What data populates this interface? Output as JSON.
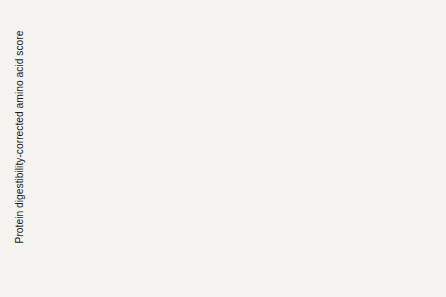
{
  "figure": {
    "background": "#f4f3f0",
    "plot_background": "#fbfaf8"
  },
  "chart_data": {
    "type": "bar",
    "title": "",
    "xlabel": "",
    "ylabel": "Protein digestibility-corrected amino acid score",
    "ylim": [
      0,
      1.2
    ],
    "minor_tick_step": 0.1,
    "grid": false,
    "legend": "none",
    "yticks": [
      0.0,
      0.2,
      0.4,
      0.6,
      0.8,
      1.0,
      1.2
    ],
    "ytick_labels": [
      "0.0",
      "0.2",
      "0.4",
      "0.6",
      "0.8",
      "1.0",
      "1.2"
    ],
    "categories": [
      "Casein",
      "Egg white",
      "Soy protein concentrate",
      "Soy protein isolate",
      "Beef",
      "Pea flour",
      "Kidney beans",
      "Rolled oats",
      "Lentils",
      "Peanut meal",
      "Whole wheat",
      "Wheat gluten"
    ],
    "category_label_lines": [
      [
        "Casein"
      ],
      [
        "Egg",
        "white"
      ],
      [
        "Soy",
        "protein",
        "concentrate"
      ],
      [
        "Soy",
        "protein",
        "isolate"
      ],
      [
        "Beef"
      ],
      [
        "Pea",
        "flour"
      ],
      [
        "Kidney",
        "beans"
      ],
      [
        "Rolled",
        "oats"
      ],
      [
        "Lentils"
      ],
      [
        "Peanut",
        "meal"
      ],
      [
        "Whole",
        "wheat"
      ],
      [
        "Wheat",
        "gluten"
      ]
    ],
    "values": [
      1.0,
      1.0,
      0.99,
      0.92,
      0.92,
      0.69,
      0.68,
      0.57,
      0.52,
      0.52,
      0.42,
      0.25
    ],
    "bar_fills": [
      "solid",
      "solid",
      "open",
      "open",
      "solid",
      "hatched",
      "hatched",
      "hatched",
      "hatched",
      "hatched",
      "hatched",
      "hatched"
    ],
    "colors": {
      "solid_fill": "#6f6f6f",
      "open_fill": "#fdfdfc",
      "hatch_line": "#8f8f8f",
      "outline": "#2b2b2b",
      "text": "#1b1b1b"
    }
  }
}
